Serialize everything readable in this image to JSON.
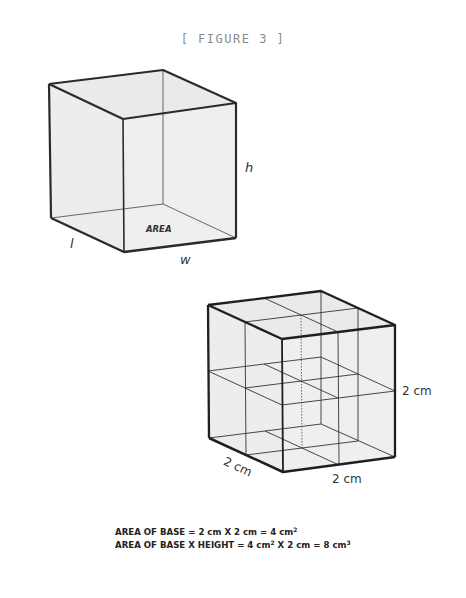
{
  "figure": {
    "title": "[ FIGURE 3 ]"
  },
  "cube1": {
    "labels": {
      "height": "h",
      "length": "l",
      "width": "w",
      "base": "AREA"
    }
  },
  "cube2": {
    "labels": {
      "height": "2 cm",
      "length": "2 cm",
      "width": "2 cm"
    },
    "grid": "2 x 2 x 2 unit cubes"
  },
  "formulas": {
    "line1": {
      "prefix": "AREA OF BASE = 2 cm X 2 cm = 4 cm",
      "sup": "2"
    },
    "line2": {
      "prefix": "AREA OF BASE X HEIGHT = 4 cm",
      "sup1": "2",
      "middle": " X 2 cm = 8 cm",
      "sup2": "3"
    }
  },
  "colors": {
    "face_fill": "#ececec",
    "edge": "#2b2b2b",
    "thin": "#333333",
    "title": "#8a8a8a"
  }
}
